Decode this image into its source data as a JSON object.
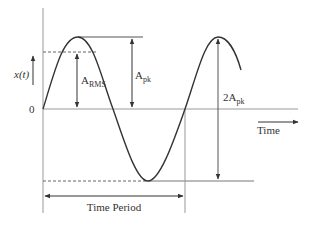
{
  "diagram": {
    "y_axis_label": "x(t)",
    "origin_label": "0",
    "x_axis_label": "Time",
    "labels": {
      "rms": {
        "main": "A",
        "sub": "RMS"
      },
      "peak": {
        "main": "A",
        "sub": "pk"
      },
      "peak_to_peak": {
        "main": "2A",
        "sub": "pk"
      },
      "period": "Time Period"
    },
    "colors": {
      "curve": "#333333",
      "axis": "#999999",
      "text": "#333333"
    }
  }
}
